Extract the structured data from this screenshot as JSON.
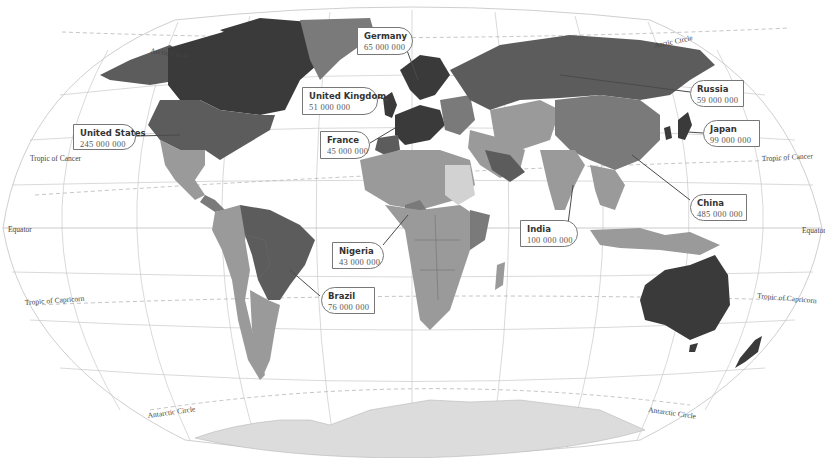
{
  "map": {
    "projection": "Winkel Tripel world map (grayscale choropleth)",
    "latitude_labels": {
      "arctic_left": "Arctic Circle",
      "arctic_right": "Arctic Circle",
      "cancer_left": "Tropic of Cancer",
      "cancer_right": "Tropic of Cancer",
      "equator_left": "Equator",
      "equator_right": "Equator",
      "capricorn_left": "Tropic of Capricorn",
      "capricorn_right": "Tropic of Capricorn",
      "antarctic_left": "Antarctic Circle",
      "antarctic_right": "Antarctic Circle"
    },
    "palette": {
      "darkest": "#3a3a3a",
      "dark": "#5c5c5c",
      "mid": "#7a7a7a",
      "light_mid": "#9a9a9a",
      "light": "#b5b5b5",
      "lightest": "#d2d2d2",
      "antarctica": "#dcdcdc"
    }
  },
  "callouts": [
    {
      "id": "germany",
      "name": "Germany",
      "value": "65 000 000"
    },
    {
      "id": "united-kingdom",
      "name": "United Kingdom",
      "value": "51 000 000"
    },
    {
      "id": "united-states",
      "name": "United States",
      "value": "245 000 000"
    },
    {
      "id": "france",
      "name": "France",
      "value": "45 000 000"
    },
    {
      "id": "russia",
      "name": "Russia",
      "value": "59 000 000"
    },
    {
      "id": "japan",
      "name": "Japan",
      "value": "99 000 000"
    },
    {
      "id": "china",
      "name": "China",
      "value": "485 000 000"
    },
    {
      "id": "india",
      "name": "India",
      "value": "100 000 000"
    },
    {
      "id": "nigeria",
      "name": "Nigeria",
      "value": "43 000 000"
    },
    {
      "id": "brazil",
      "name": "Brazil",
      "value": "76 000 000"
    }
  ]
}
